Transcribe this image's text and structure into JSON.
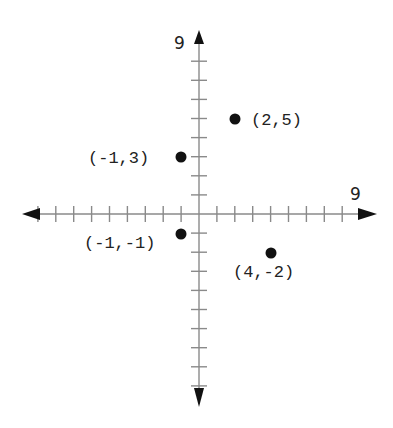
{
  "chart_data": {
    "type": "scatter",
    "title": "",
    "xlabel": "",
    "ylabel": "",
    "xlim": [
      -9,
      9
    ],
    "ylim": [
      -9,
      9
    ],
    "x_tick_step": 1,
    "y_tick_step": 1,
    "grid": false,
    "axis_labels": {
      "x_max": "9",
      "y_max": "9"
    },
    "points": [
      {
        "x": 2,
        "y": 5,
        "label": "(2,5)"
      },
      {
        "x": -1,
        "y": 3,
        "label": "(-1,3)"
      },
      {
        "x": -1,
        "y": -1,
        "label": "(-1,-1)"
      },
      {
        "x": 4,
        "y": -2,
        "label": "(4,-2)"
      }
    ]
  },
  "layout": {
    "origin_px": [
      199,
      214
    ],
    "unit_x_px": 17.9,
    "unit_y_px": 19.1
  },
  "colors": {
    "axis": "#8a8a8a",
    "arrow": "#111111",
    "point": "#111111",
    "text": "#222222"
  },
  "labels": {
    "p0": "(2,5)",
    "p1": "(-1,3)",
    "p2": "(-1,-1)",
    "p3": "(4,-2)",
    "x_max": "9",
    "y_max": "9"
  }
}
